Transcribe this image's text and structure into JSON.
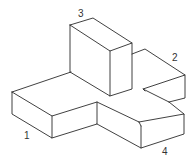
{
  "diagram": {
    "type": "isometric-solid",
    "labels": [
      {
        "id": "1",
        "text": "1",
        "x": 24,
        "y": 130
      },
      {
        "id": "2",
        "text": "2",
        "x": 171,
        "y": 53
      },
      {
        "id": "3",
        "text": "3",
        "x": 77,
        "y": 9
      },
      {
        "id": "4",
        "text": "4",
        "x": 162,
        "y": 148
      }
    ],
    "colors": {
      "line": "#2b2b2b",
      "background": "#ffffff",
      "label": "#333333"
    }
  }
}
